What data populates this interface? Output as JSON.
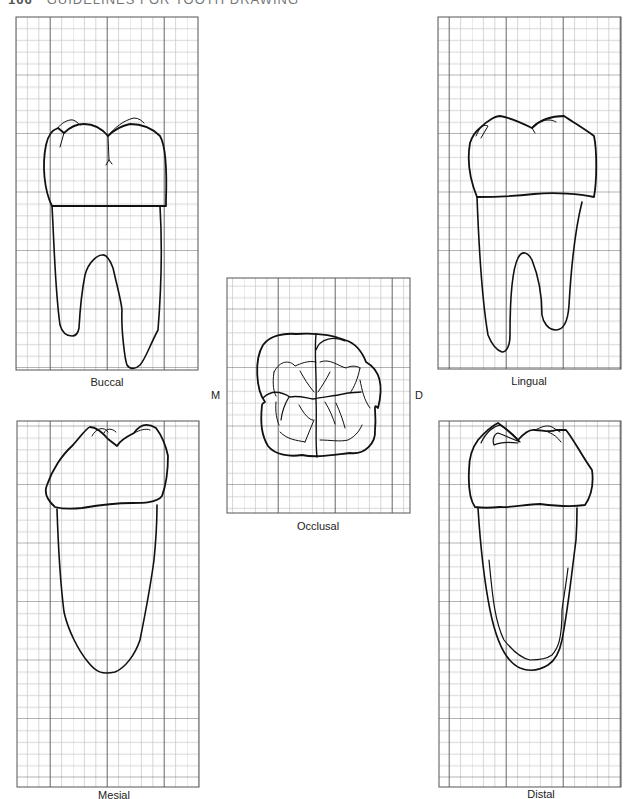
{
  "header": {
    "page_number": "166",
    "running_title": "GUIDELINES FOR TOOTH DRAWING"
  },
  "views": {
    "buccal": {
      "label": "Buccal"
    },
    "lingual": {
      "label": "Lingual"
    },
    "occlusal": {
      "label": "Occlusal",
      "left_marker": "M",
      "right_marker": "D"
    },
    "mesial": {
      "label": "Mesial"
    },
    "distal": {
      "label": "Distal"
    }
  },
  "colors": {
    "grid_minor": "#bdbdbd",
    "grid_major": "#555555",
    "outline": "#111111"
  }
}
